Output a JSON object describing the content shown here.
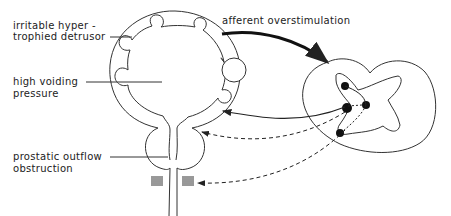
{
  "diagram": {
    "labels": {
      "detrusor_line1": "irritable  hyper -",
      "detrusor_line2": "trophied  detrusor",
      "pressure_line1": "high  voiding",
      "pressure_line2": "pressure",
      "prostate_line1": "prostatic  outflow",
      "prostate_line2": "obstruction",
      "afferent": "afferent  overstimulation"
    },
    "colors": {
      "stroke": "#333333",
      "background": "#ffffff"
    }
  }
}
